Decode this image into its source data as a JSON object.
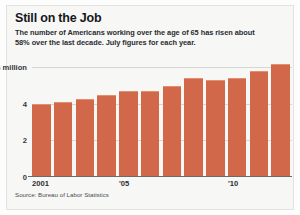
{
  "title": "Still on the Job",
  "subtitle": "The number of Americans working over the age of 65 has risen about 58% over the last decade. July figures for each year.",
  "source": "Source: Bureau of Labor Statistics",
  "colors": {
    "bar": "#d2684a",
    "bar_top": "#e58d6f",
    "gridline": "#d6d6d2",
    "baseline": "#6a6a66",
    "paper": "#f7f7f5",
    "text": "#16181b"
  },
  "chart_data": {
    "type": "bar",
    "title": "Still on the Job",
    "subtitle": "The number of Americans working over the age of 65 has risen about 58% over the last decade. July figures for each year.",
    "xlabel": "",
    "ylabel": "",
    "ylim": [
      0,
      6.3
    ],
    "grid": true,
    "legend": false,
    "units": "millions of workers age 65+",
    "categories": [
      "2001",
      "2002",
      "2003",
      "2004",
      "2005",
      "2006",
      "2007",
      "2008",
      "2009",
      "2010",
      "2011",
      "2012"
    ],
    "values": [
      4.0,
      4.1,
      4.3,
      4.5,
      4.7,
      4.7,
      5.0,
      5.4,
      5.3,
      5.4,
      5.8,
      6.2
    ],
    "ytick_values": [
      0,
      2,
      4,
      6
    ],
    "ytick_labels": [
      "0",
      "2",
      "4",
      "6 million"
    ],
    "xtick_labels": [
      {
        "index": 0,
        "label": "2001"
      },
      {
        "index": 4,
        "label": "'05"
      },
      {
        "index": 9,
        "label": "'10"
      }
    ]
  }
}
